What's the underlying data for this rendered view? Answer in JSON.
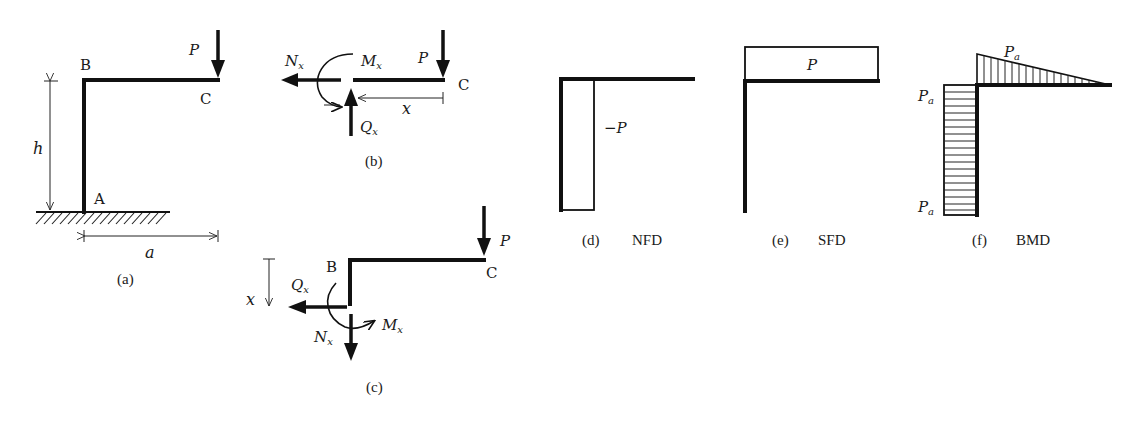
{
  "figure": {
    "panels": {
      "a": {
        "caption": "(a)",
        "labels": {
          "B": "B",
          "C": "C",
          "A": "A",
          "P": "P",
          "h": "h",
          "a": "a"
        }
      },
      "b": {
        "caption": "(b)",
        "labels": {
          "P": "P",
          "C": "C",
          "Nx": "N",
          "Nx_sub": "x",
          "Mx": "M",
          "Mx_sub": "x",
          "Qx": "Q",
          "Qx_sub": "x",
          "x": "x"
        }
      },
      "c": {
        "caption": "(c)",
        "labels": {
          "B": "B",
          "C": "C",
          "P": "P",
          "x": "x",
          "Qx": "Q",
          "Qx_sub": "x",
          "Nx": "N",
          "Nx_sub": "x",
          "Mx": "M",
          "Mx_sub": "x"
        }
      },
      "d": {
        "caption": "(d)",
        "title": "NFD",
        "value_label": "−P"
      },
      "e": {
        "caption": "(e)",
        "title": "SFD",
        "value_label": "P"
      },
      "f": {
        "caption": "(f)",
        "title": "BMD",
        "labels": {
          "top": "P",
          "top_sub": "a",
          "corner": "P",
          "corner_sub": "a",
          "bottom": "P",
          "bottom_sub": "a"
        }
      }
    }
  }
}
